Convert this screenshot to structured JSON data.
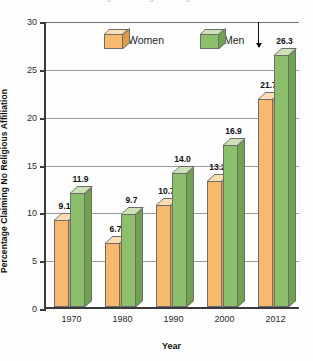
{
  "chart_data": {
    "type": "bar",
    "title": "",
    "xlabel": "Year",
    "ylabel": "Percentage Claiming No Religious Affiliation",
    "categories": [
      "1970",
      "1980",
      "1990",
      "2000",
      "2012"
    ],
    "series": [
      {
        "name": "Women",
        "values": [
          9.1,
          6.7,
          10.7,
          13.2,
          21.7
        ],
        "color": "#f6b96d"
      },
      {
        "name": "Men",
        "values": [
          11.9,
          9.7,
          14.0,
          16.9,
          26.3
        ],
        "color": "#8cbf6b"
      }
    ],
    "ylim": [
      0,
      30
    ],
    "yticks": [
      "0",
      "5",
      "10",
      "15",
      "20",
      "25",
      "30"
    ],
    "grid": true,
    "legend_position": "top-center",
    "annotations": [
      "arrow pointing down to 26.3 value label"
    ]
  },
  "legend": {
    "women_label": "Women",
    "men_label": "Men"
  },
  "axes": {
    "y_title": "Percentage Claiming No Religious Affiliation",
    "x_title": "Year"
  },
  "title_sliver": "Percentage Claiming No Religious Affiliation"
}
